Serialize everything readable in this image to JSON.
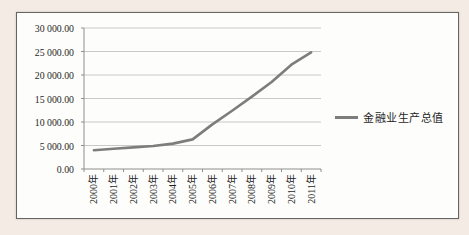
{
  "page": {
    "background": "#f4ebe5"
  },
  "chart": {
    "legend": {
      "label": "金融业生产总值"
    },
    "colors": {
      "series": "#7d7d7d",
      "grid": "#c9c9c9",
      "axis": "#8f8f8f",
      "frame_border": "#646464",
      "text": "#1f1f1f",
      "plot_background": "#fdfdfb",
      "page_background": "#f4ebe5"
    }
  },
  "chart_data": {
    "type": "line",
    "title": "",
    "xlabel": "",
    "ylabel": "",
    "categories": [
      "2000年",
      "2001年",
      "2002年",
      "2003年",
      "2004年",
      "2005年",
      "2006年",
      "2007年",
      "2008年",
      "2009年",
      "2010年",
      "2011年"
    ],
    "series": [
      {
        "name": "金融业生产总值",
        "values": [
          4000,
          4300,
          4600,
          4900,
          5400,
          6300,
          9500,
          12400,
          15400,
          18500,
          22200,
          24800
        ]
      }
    ],
    "ylim": [
      0,
      30000
    ],
    "y_ticks": [
      {
        "value": 0,
        "label": "0.00"
      },
      {
        "value": 5000,
        "label": "5 000.00"
      },
      {
        "value": 10000,
        "label": "10 000.00"
      },
      {
        "value": 15000,
        "label": "15 000.00"
      },
      {
        "value": 20000,
        "label": "20 000.00"
      },
      {
        "value": 25000,
        "label": "25 000.00"
      },
      {
        "value": 30000,
        "label": "30 000.00"
      }
    ],
    "grid": true,
    "legend_position": "right",
    "x_label_rotation": -90
  }
}
